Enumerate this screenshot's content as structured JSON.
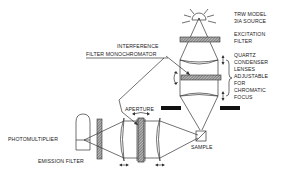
{
  "diagram": {
    "labels": {
      "source_line1": "TRW MODEL",
      "source_line2": "3IA SOURCE",
      "excitation_line1": "EXCITATION",
      "excitation_line2": "FILTER",
      "quartz_line1": "QUARTZ",
      "quartz_line2": "CONDENSER",
      "quartz_line3": "LENSES",
      "quartz_line4": "ADJUSTABLE",
      "quartz_line5": "FOR",
      "quartz_line6": "CHROMATIC",
      "quartz_line7": "FOCUS",
      "interference_line1": "INTERFERENCE",
      "interference_line2": "FILTER MONOCHROMATOR",
      "aperture": "APERTURE",
      "photomultiplier": "PHOTOMULTIPLIER",
      "emission_filter": "EMISSION FILTER",
      "sample": "SAMPLE"
    },
    "colors": {
      "ink": "#333333",
      "hatch": "#555555",
      "aperture_block": "#111111"
    }
  }
}
